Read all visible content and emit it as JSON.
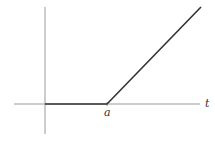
{
  "diagram": {
    "x_axis_label": "t",
    "kink_label": "a",
    "colors": {
      "axis": "#9a9a9a",
      "curve": "#333333",
      "background": "#ffffff"
    },
    "geometry": {
      "x_axis": {
        "x1": 14,
        "x2": 200,
        "y": 104
      },
      "y_axis": {
        "x": 45,
        "y1": 7,
        "y2": 134
      },
      "curve_points": [
        [
          45,
          104
        ],
        [
          107,
          104
        ],
        [
          201,
          7
        ]
      ]
    }
  }
}
